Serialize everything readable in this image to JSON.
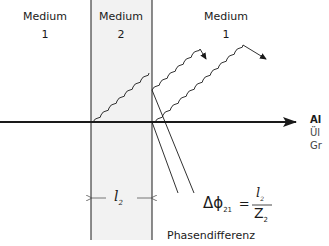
{
  "media": [
    {
      "name": "Medium",
      "number": "1"
    },
    {
      "name": "Medium",
      "number": "2"
    },
    {
      "name": "Medium",
      "number": "1"
    }
  ],
  "thickness_label": {
    "symbol": "l",
    "subscript": "2"
  },
  "formula": {
    "lhs": "Δϕ",
    "lhs_subscript": "21",
    "equals": "=",
    "numerator": "l",
    "numerator_subscript": "2",
    "denominator": "Z",
    "denominator_subscript": "2"
  },
  "caption": "Phasendifferenz",
  "right_edge_text": [
    "Al",
    "Ül",
    "Gr"
  ],
  "colors": {
    "line": "#1a1a1a",
    "medium2_fill": "#f2f2f2"
  }
}
